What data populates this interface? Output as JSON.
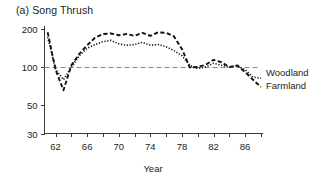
{
  "panel": {
    "title": "(a) Song Thrush"
  },
  "chart_data": {
    "type": "line",
    "title": "(a) Song Thrush",
    "xlabel": "Year",
    "ylabel": "",
    "yscale": "log",
    "ylim": [
      30,
      215
    ],
    "xlim": [
      1960.6,
      1988.2
    ],
    "ytick_labels": [
      "200",
      "100",
      "50",
      "30"
    ],
    "yticks": [
      200,
      100,
      50,
      30
    ],
    "xtick_labels": [
      "62",
      "66",
      "70",
      "74",
      "78",
      "82",
      "86"
    ],
    "xticks": [
      1962,
      1966,
      1970,
      1974,
      1978,
      1982,
      1986
    ],
    "xminor_ticks": [
      1962,
      1964,
      1966,
      1968,
      1970,
      1972,
      1974,
      1976,
      1978,
      1980,
      1982,
      1984,
      1986,
      1988
    ],
    "grid": false,
    "reference_line": 100,
    "legend_position": "right",
    "x": [
      1961,
      1962,
      1963,
      1964,
      1965,
      1966,
      1967,
      1968,
      1969,
      1970,
      1971,
      1972,
      1973,
      1974,
      1975,
      1976,
      1977,
      1978,
      1979,
      1980,
      1981,
      1982,
      1983,
      1984,
      1985,
      1986,
      1987,
      1988
    ],
    "series": [
      {
        "name": "Farmland",
        "style": "dashed",
        "values": [
          190,
          96,
          66,
          104,
          128,
          150,
          172,
          184,
          186,
          180,
          184,
          178,
          188,
          178,
          190,
          188,
          176,
          140,
          100,
          101,
          105,
          115,
          110,
          101,
          104,
          92,
          80,
          70
        ]
      },
      {
        "name": "Woodland",
        "style": "dotted",
        "values": [
          174,
          97,
          80,
          100,
          124,
          142,
          152,
          160,
          164,
          154,
          150,
          152,
          158,
          150,
          152,
          146,
          136,
          124,
          104,
          98,
          101,
          108,
          104,
          100,
          103,
          96,
          84,
          82
        ]
      }
    ],
    "annotations": []
  },
  "legend": {
    "items": [
      {
        "label": "Woodland",
        "style": "dotted"
      },
      {
        "label": "Farmland",
        "style": "dashed"
      }
    ]
  },
  "axis": {
    "x_title": "Year"
  }
}
